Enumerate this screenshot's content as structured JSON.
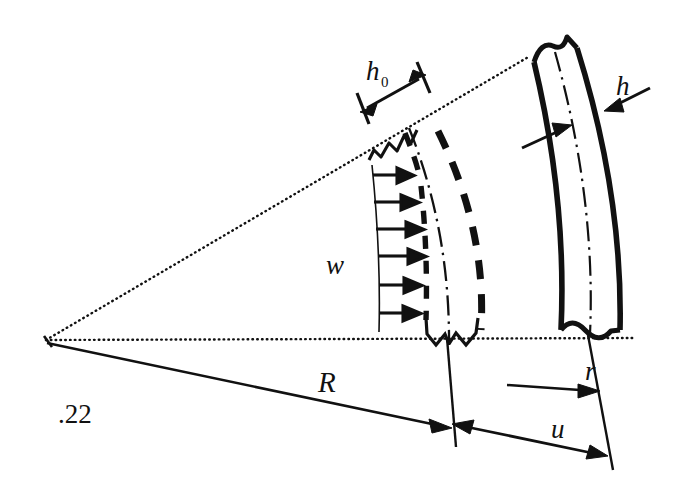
{
  "figure": {
    "kind": "engineering-schematic",
    "caption_number": ".22",
    "background_color": "#ffffff",
    "line_color": "#111111"
  },
  "labels": {
    "h0": "h",
    "h0_subscript": "0",
    "h": "h",
    "w": "w",
    "R": "R",
    "r": "r",
    "u": "u",
    "figure_id": ".22"
  },
  "label_positions": {
    "h0": {
      "x": 368,
      "y": 75
    },
    "h0_sub": {
      "x": 383,
      "y": 81
    },
    "h": {
      "x": 617,
      "y": 90
    },
    "w": {
      "x": 331,
      "y": 270
    },
    "R": {
      "x": 323,
      "y": 390
    },
    "r": {
      "x": 590,
      "y": 377
    },
    "u": {
      "x": 558,
      "y": 432
    },
    "figure_id": {
      "x": 63,
      "y": 418
    }
  },
  "geometry": {
    "apex": {
      "x": 45,
      "y": 341
    },
    "inner_radius_px": 340,
    "outer_radius_px": 590,
    "angle_top_deg": -26.5,
    "angle_bottom_deg": 0.0
  },
  "annotations": {
    "h0_dimension": "double-headed arrow across inner film thickness",
    "h_dimension": "inward-pointing arrows across outer band thickness",
    "w_profile": "six radial velocity arrows forming a flow profile",
    "R_dimension": "radius from apex to inner arc",
    "r_dimension": "single arrow to outer arc",
    "u_dimension": "double-headed arrow spanning outer gap",
    "break_symbols": "zigzag and wavy break marks on arcs"
  }
}
